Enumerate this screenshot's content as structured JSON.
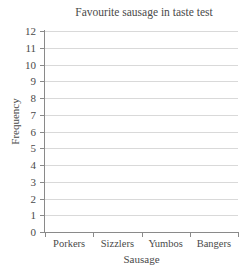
{
  "chart_data": {
    "type": "bar",
    "title": "Favourite sausage in taste test",
    "xlabel": "Sausage",
    "ylabel": "Frequency",
    "categories": [
      "Porkers",
      "Sizzlers",
      "Yumbos",
      "Bangers"
    ],
    "values": [
      null,
      null,
      null,
      null
    ],
    "series": [
      {
        "name": "Frequency",
        "values": [
          null,
          null,
          null,
          null
        ]
      }
    ],
    "ylim": [
      0,
      12
    ],
    "ytick_step": 1,
    "ytick_labels": [
      "12",
      "11",
      "10",
      "9",
      "8",
      "7",
      "6",
      "5",
      "4",
      "3",
      "2",
      "1",
      "0"
    ],
    "grid": true,
    "grid_axis": "y",
    "legend": false,
    "legend_position": "none",
    "note": "empty bar chart template - no bars plotted",
    "colors": {
      "background": "#ffffff",
      "gridline": "#d9d9d9",
      "axis": "#8a8a8a",
      "text": "#4a4a4a"
    }
  }
}
